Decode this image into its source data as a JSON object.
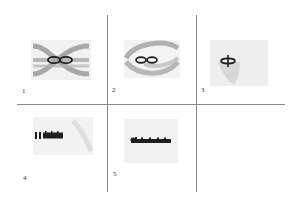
{
  "figure": {
    "grid": {
      "columns": 3,
      "rows": 2
    },
    "panels": [
      {
        "label": "1",
        "content": "gray crossing bands with dark infinity-shaped knot"
      },
      {
        "label": "2",
        "content": "gray looping band with dark infinity-shaped knot"
      },
      {
        "label": "3",
        "content": "faint gray blob with small dark cross-shaped knot"
      },
      {
        "label": "4",
        "content": "faint gray blob with dark elongated striped bar"
      },
      {
        "label": "5",
        "content": "faint gray blob with dark elongated bar with knob at left"
      },
      {
        "label": "",
        "content": "empty"
      }
    ]
  },
  "colors": {
    "line": "#8a8a8a",
    "band": "#9a9a9a",
    "knot": "#1e1e1e",
    "haze": "#e2e2e2"
  }
}
